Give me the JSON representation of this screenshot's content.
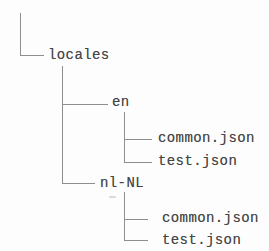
{
  "diagram": {
    "type": "file-tree",
    "root": {
      "label": "locales",
      "children": [
        {
          "label": "en",
          "children": [
            {
              "label": "common.json"
            },
            {
              "label": "test.json"
            }
          ]
        },
        {
          "label": "nl-NL",
          "children": [
            {
              "label": "common.json"
            },
            {
              "label": "test.json"
            }
          ]
        }
      ]
    }
  }
}
